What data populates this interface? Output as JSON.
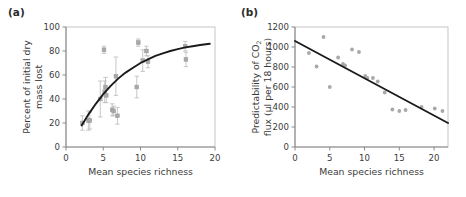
{
  "figure": {
    "background": "#ffffff",
    "point_color": "#a8a8a8",
    "errorbar_color": "#bdbdbd",
    "curve_color": "#1a1a1a",
    "axis_color": "#8a8a8a",
    "text_color": "#3b3b3b"
  },
  "panels": [
    {
      "id": "a",
      "label": "(a)",
      "xlabel": "Mean species richness",
      "ylabel_lines": [
        "Percent of initial dry",
        "mass lost"
      ],
      "xticks": [
        0,
        5,
        10,
        15,
        20
      ],
      "yticks": [
        0,
        20,
        40,
        60,
        80,
        100
      ],
      "xlim": [
        0,
        20
      ],
      "ylim": [
        0,
        100
      ]
    },
    {
      "id": "b",
      "label": "(b)",
      "xlabel": "Mean species richness",
      "ylabel_lines": [
        "Predictability of CO2",
        "flux (µl per 18 hours)"
      ],
      "ylabel_sub": "2",
      "xticks": [
        0,
        5,
        10,
        15,
        20
      ],
      "yticks": [
        0,
        200,
        400,
        600,
        800,
        1000,
        1200
      ],
      "xlim": [
        0,
        22
      ],
      "ylim": [
        0,
        1200
      ]
    }
  ],
  "chart_data": [
    {
      "type": "scatter",
      "panel": "a",
      "title": "",
      "xlabel": "Mean species richness",
      "ylabel": "Percent of initial dry mass lost",
      "xlim": [
        0,
        20
      ],
      "ylim": [
        0,
        100
      ],
      "xticks": [
        0,
        5,
        10,
        15,
        20
      ],
      "yticks": [
        0,
        20,
        40,
        60,
        80,
        100
      ],
      "grid": false,
      "legend": "none",
      "error_bars": "vertical, symmetric standard error",
      "points": [
        {
          "x": 2.2,
          "y": 20,
          "yerr": 6
        },
        {
          "x": 3.0,
          "y": 22,
          "yerr": 8
        },
        {
          "x": 3.2,
          "y": 22,
          "yerr": 7
        },
        {
          "x": 4.6,
          "y": 40,
          "yerr": 15
        },
        {
          "x": 5.1,
          "y": 81,
          "yerr": 3
        },
        {
          "x": 5.2,
          "y": 46,
          "yerr": 9
        },
        {
          "x": 5.3,
          "y": 50,
          "yerr": 8
        },
        {
          "x": 5.4,
          "y": 43,
          "yerr": 6
        },
        {
          "x": 6.2,
          "y": 31,
          "yerr": 5
        },
        {
          "x": 6.4,
          "y": 30,
          "yerr": 4
        },
        {
          "x": 6.7,
          "y": 59,
          "yerr": 16
        },
        {
          "x": 6.9,
          "y": 26,
          "yerr": 7
        },
        {
          "x": 9.5,
          "y": 50,
          "yerr": 9
        },
        {
          "x": 9.7,
          "y": 87,
          "yerr": 3
        },
        {
          "x": 10.3,
          "y": 72,
          "yerr": 9
        },
        {
          "x": 10.8,
          "y": 80,
          "yerr": 4
        },
        {
          "x": 11.0,
          "y": 71,
          "yerr": 5
        },
        {
          "x": 16.0,
          "y": 84,
          "yerr": 4
        },
        {
          "x": 16.1,
          "y": 73,
          "yerr": 6
        }
      ],
      "fit": {
        "kind": "saturating-curve",
        "description": "increasing concave-down curve",
        "points": [
          {
            "x": 2.1,
            "y": 18
          },
          {
            "x": 3.0,
            "y": 27
          },
          {
            "x": 4.0,
            "y": 36
          },
          {
            "x": 5.0,
            "y": 44
          },
          {
            "x": 6.0,
            "y": 51
          },
          {
            "x": 7.0,
            "y": 57
          },
          {
            "x": 8.0,
            "y": 62
          },
          {
            "x": 9.0,
            "y": 66
          },
          {
            "x": 10.0,
            "y": 70
          },
          {
            "x": 11.0,
            "y": 73
          },
          {
            "x": 12.0,
            "y": 76
          },
          {
            "x": 13.0,
            "y": 78
          },
          {
            "x": 14.0,
            "y": 80
          },
          {
            "x": 15.0,
            "y": 81.5
          },
          {
            "x": 16.0,
            "y": 83
          },
          {
            "x": 17.0,
            "y": 84
          },
          {
            "x": 18.0,
            "y": 85
          },
          {
            "x": 19.3,
            "y": 86
          }
        ]
      }
    },
    {
      "type": "scatter",
      "panel": "b",
      "title": "",
      "xlabel": "Mean species richness",
      "ylabel": "Predictability of CO2 flux (µl per 18 hours)",
      "xlim": [
        0,
        22
      ],
      "ylim": [
        0,
        1200
      ],
      "xticks": [
        0,
        5,
        10,
        15,
        20
      ],
      "yticks": [
        0,
        200,
        400,
        600,
        800,
        1000,
        1200
      ],
      "grid": false,
      "legend": "none",
      "error_bars": "none",
      "points": [
        {
          "x": 2.0,
          "y": 940
        },
        {
          "x": 3.1,
          "y": 805
        },
        {
          "x": 4.1,
          "y": 1100
        },
        {
          "x": 5.0,
          "y": 600
        },
        {
          "x": 6.2,
          "y": 895
        },
        {
          "x": 6.9,
          "y": 830
        },
        {
          "x": 7.2,
          "y": 815
        },
        {
          "x": 8.2,
          "y": 975
        },
        {
          "x": 9.2,
          "y": 950
        },
        {
          "x": 10.1,
          "y": 710
        },
        {
          "x": 10.4,
          "y": 690
        },
        {
          "x": 11.2,
          "y": 690
        },
        {
          "x": 11.9,
          "y": 655
        },
        {
          "x": 12.9,
          "y": 545
        },
        {
          "x": 14.0,
          "y": 375
        },
        {
          "x": 15.0,
          "y": 360
        },
        {
          "x": 15.9,
          "y": 370
        },
        {
          "x": 18.2,
          "y": 400
        },
        {
          "x": 20.1,
          "y": 385
        },
        {
          "x": 21.2,
          "y": 360
        }
      ],
      "fit": {
        "kind": "linear",
        "description": "decreasing straight regression line",
        "endpoints": [
          {
            "x": 0.0,
            "y": 1060
          },
          {
            "x": 22.0,
            "y": 240
          }
        ],
        "slope": -37.3,
        "intercept": 1060
      }
    }
  ]
}
